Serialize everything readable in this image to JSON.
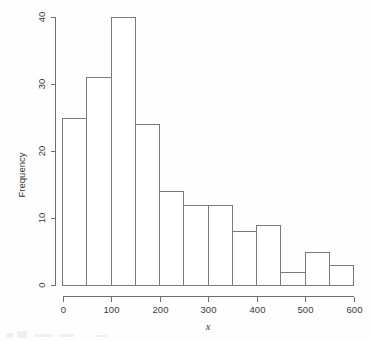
{
  "chart_data": {
    "type": "bar",
    "title": "",
    "subtitle": "",
    "xlabel": "x",
    "ylabel": "Frequency",
    "bin_width": 50,
    "categories": [
      "0-50",
      "50-100",
      "100-150",
      "150-200",
      "200-250",
      "250-300",
      "300-350",
      "350-400",
      "400-450",
      "450-500",
      "500-550",
      "550-600"
    ],
    "bin_edges": [
      0,
      50,
      100,
      150,
      200,
      250,
      300,
      350,
      400,
      450,
      500,
      550,
      600
    ],
    "values": [
      25,
      31,
      40,
      24,
      14,
      12,
      12,
      8,
      9,
      2,
      5,
      3
    ],
    "xlim": [
      0,
      600
    ],
    "ylim": [
      0,
      40
    ],
    "x_ticks": [
      0,
      100,
      200,
      300,
      400,
      500,
      600
    ],
    "x_tick_labels": [
      "0",
      "100",
      "200",
      "300",
      "400",
      "500",
      "600"
    ],
    "y_ticks": [
      0,
      10,
      20,
      30,
      40
    ],
    "y_tick_labels": [
      "0",
      "10",
      "20",
      "30",
      "40"
    ],
    "grid": false,
    "legend": false,
    "legend_position": "none",
    "bar_fill_color": "#ffffff",
    "bar_stroke_color": "#7a7a7a",
    "axis_color": "#6e6e6e",
    "text_color": "#3a3a3a",
    "background_color": "#fefefe"
  }
}
